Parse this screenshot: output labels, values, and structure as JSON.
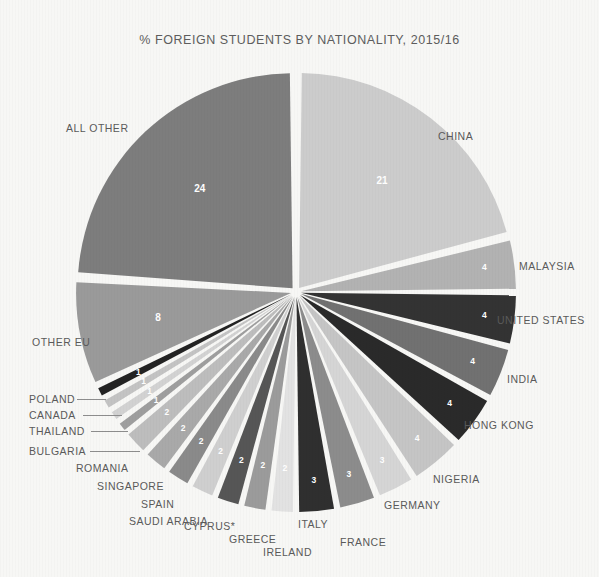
{
  "chart": {
    "title": "% FOREIGN STUDENTS BY NATIONALITY, 2015/16"
  },
  "chart_data": {
    "type": "pie",
    "title": "% FOREIGN STUDENTS BY NATIONALITY, 2015/16",
    "xlabel": "",
    "ylabel": "",
    "unit": "%",
    "legend_position": "none",
    "grid": false,
    "note": "Slice values are percentages of all foreign students; labels placed radially around an exploded pie.",
    "categories": [
      "CHINA",
      "MALAYSIA",
      "UNITED STATES",
      "INDIA",
      "HONG KONG",
      "NIGERIA",
      "GERMANY",
      "FRANCE",
      "ITALY",
      "IRELAND",
      "GREECE",
      "CYPRUS*",
      "SAUDI ARABIA",
      "SPAIN",
      "SINGAPORE",
      "ROMANIA",
      "BULGARIA",
      "THAILAND",
      "CANADA",
      "POLAND",
      "OTHER EU",
      "ALL OTHER"
    ],
    "values": [
      21,
      4,
      4,
      4,
      4,
      4,
      3,
      3,
      3,
      2,
      2,
      2,
      2,
      2,
      2,
      2,
      1,
      1,
      1,
      1,
      8,
      24
    ],
    "slices": [
      {
        "label": "CHINA",
        "value": 21,
        "value_text": "21",
        "color": "#cccccc"
      },
      {
        "label": "MALAYSIA",
        "value": 4,
        "value_text": "4",
        "color": "#b2b2b2"
      },
      {
        "label": "UNITED STATES",
        "value": 4,
        "value_text": "4",
        "color": "#333333"
      },
      {
        "label": "INDIA",
        "value": 4,
        "value_text": "4",
        "color": "#717171"
      },
      {
        "label": "HONG KONG",
        "value": 4,
        "value_text": "4",
        "color": "#2a2a2a"
      },
      {
        "label": "NIGERIA",
        "value": 4,
        "value_text": "4",
        "color": "#c5c5c5"
      },
      {
        "label": "GERMANY",
        "value": 3,
        "value_text": "3",
        "color": "#d5d5d5"
      },
      {
        "label": "FRANCE",
        "value": 3,
        "value_text": "3",
        "color": "#8c8c8c"
      },
      {
        "label": "ITALY",
        "value": 3,
        "value_text": "3",
        "color": "#2f2f2f"
      },
      {
        "label": "IRELAND",
        "value": 2,
        "value_text": "2",
        "color": "#e2e2e2"
      },
      {
        "label": "GREECE",
        "value": 2,
        "value_text": "2",
        "color": "#9b9b9b"
      },
      {
        "label": "CYPRUS*",
        "value": 2,
        "value_text": "2",
        "color": "#565656"
      },
      {
        "label": "SAUDI ARABIA",
        "value": 2,
        "value_text": "2",
        "color": "#cfcfcf"
      },
      {
        "label": "SPAIN",
        "value": 2,
        "value_text": "2",
        "color": "#8a8a8a"
      },
      {
        "label": "SINGAPORE",
        "value": 2,
        "value_text": "2",
        "color": "#a9a9a9"
      },
      {
        "label": "ROMANIA",
        "value": 2,
        "value_text": "2",
        "color": "#bdbdbd"
      },
      {
        "label": "BULGARIA",
        "value": 1,
        "value_text": "1",
        "color": "#9e9e9e"
      },
      {
        "label": "THAILAND",
        "value": 1,
        "value_text": "1",
        "color": "#d2d2d2"
      },
      {
        "label": "CANADA",
        "value": 1,
        "value_text": "1",
        "color": "#c3c3c3"
      },
      {
        "label": "POLAND",
        "value": 1,
        "value_text": "1",
        "color": "#232323"
      },
      {
        "label": "OTHER EU",
        "value": 8,
        "value_text": "8",
        "color": "#9a9a9a"
      },
      {
        "label": "ALL OTHER",
        "value": 24,
        "value_text": "24",
        "color": "#7d7d7d"
      }
    ]
  },
  "labels": {
    "china": "CHINA",
    "malaysia": "MALAYSIA",
    "united_states": "UNITED STATES",
    "india": "INDIA",
    "hong_kong": "HONG KONG",
    "nigeria": "NIGERIA",
    "germany": "GERMANY",
    "france": "FRANCE",
    "italy": "ITALY",
    "ireland": "IRELAND",
    "greece": "GREECE",
    "cyprus": "CYPRUS*",
    "saudi_arabia": "SAUDI ARABIA",
    "spain": "SPAIN",
    "singapore": "SINGAPORE",
    "romania": "ROMANIA",
    "bulgaria": "BULGARIA",
    "thailand": "THAILAND",
    "canada": "CANADA",
    "poland": "POLAND",
    "other_eu": "OTHER EU",
    "all_other": "ALL OTHER"
  },
  "theme": {
    "background": "#f7f7f5",
    "title_color": "#5d5d5d",
    "label_color": "#5a5a5a",
    "value_color": "#ffffff",
    "leader_color": "#8d8d8d"
  }
}
